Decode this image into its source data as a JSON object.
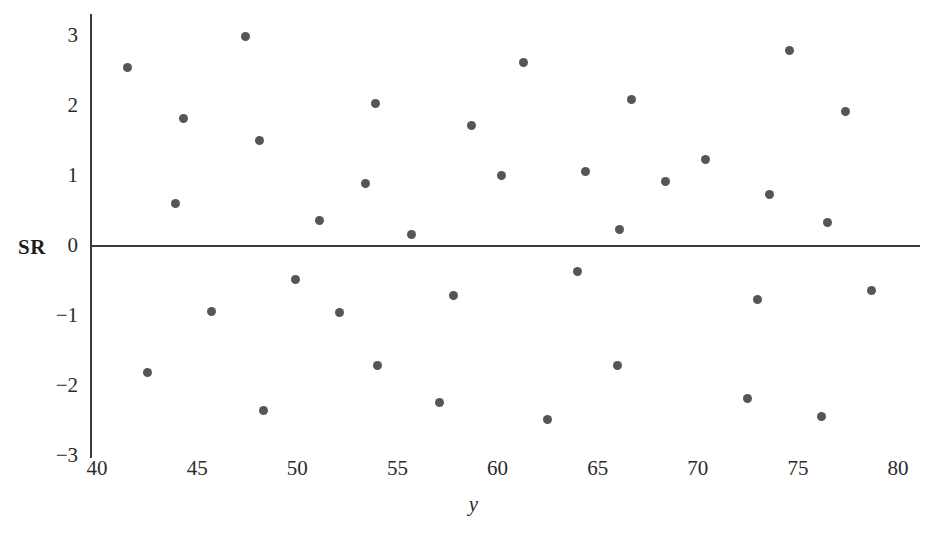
{
  "chart_data": {
    "type": "scatter",
    "title": "",
    "xlabel": "y",
    "ylabel": "SR",
    "xlim": [
      40,
      80
    ],
    "ylim": [
      -3,
      3
    ],
    "grid": false,
    "legend": null,
    "point_color": "#565656",
    "axis_color": "#3a3a3a",
    "xticks": [
      40,
      45,
      50,
      55,
      60,
      65,
      70,
      75,
      80
    ],
    "xtick_labels": [
      "40",
      "45",
      "50",
      "55",
      "60",
      "65",
      "70",
      "75",
      "80"
    ],
    "yticks": [
      -3,
      -2,
      -1,
      0,
      1,
      2,
      3
    ],
    "ytick_labels": [
      "−3",
      "−2",
      "−1",
      "0",
      "1",
      "2",
      "3"
    ],
    "points": [
      {
        "x": 41.5,
        "y": 2.55
      },
      {
        "x": 42.5,
        "y": -1.81
      },
      {
        "x": 43.9,
        "y": 0.61
      },
      {
        "x": 44.3,
        "y": 1.82
      },
      {
        "x": 45.7,
        "y": -0.93
      },
      {
        "x": 47.4,
        "y": 3.0
      },
      {
        "x": 48.1,
        "y": 1.51
      },
      {
        "x": 48.3,
        "y": -2.35
      },
      {
        "x": 49.9,
        "y": -0.48
      },
      {
        "x": 51.1,
        "y": 0.36
      },
      {
        "x": 52.1,
        "y": -0.95
      },
      {
        "x": 53.4,
        "y": 0.9
      },
      {
        "x": 53.9,
        "y": 2.03
      },
      {
        "x": 54.0,
        "y": -1.7
      },
      {
        "x": 55.7,
        "y": 0.17
      },
      {
        "x": 57.1,
        "y": -2.24
      },
      {
        "x": 57.8,
        "y": -0.71
      },
      {
        "x": 58.7,
        "y": 1.72
      },
      {
        "x": 60.2,
        "y": 1.01
      },
      {
        "x": 61.3,
        "y": 2.62
      },
      {
        "x": 62.5,
        "y": -2.48
      },
      {
        "x": 64.0,
        "y": -0.36
      },
      {
        "x": 64.4,
        "y": 1.06
      },
      {
        "x": 66.0,
        "y": -1.7
      },
      {
        "x": 66.1,
        "y": 0.23
      },
      {
        "x": 66.7,
        "y": 2.09
      },
      {
        "x": 68.4,
        "y": 0.92
      },
      {
        "x": 70.4,
        "y": 1.23
      },
      {
        "x": 72.5,
        "y": -2.18
      },
      {
        "x": 73.0,
        "y": -0.76
      },
      {
        "x": 73.6,
        "y": 0.73
      },
      {
        "x": 74.6,
        "y": 2.79
      },
      {
        "x": 76.2,
        "y": -2.43
      },
      {
        "x": 76.5,
        "y": 0.34
      },
      {
        "x": 77.4,
        "y": 1.92
      },
      {
        "x": 78.7,
        "y": -0.64
      }
    ]
  }
}
